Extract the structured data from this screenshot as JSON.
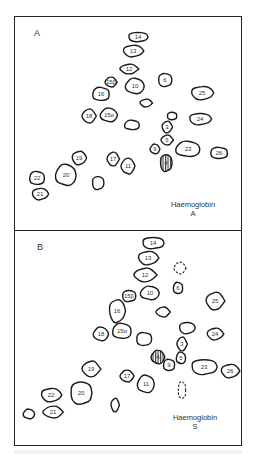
{
  "figure": {
    "panels": [
      {
        "id": "A",
        "label": "A",
        "caption_line1": "Haemoglobin",
        "caption_line2": "A",
        "spots": [
          {
            "label": "14",
            "cx": 123,
            "cy": 20,
            "rx": 10,
            "ry": 5
          },
          {
            "label": "13",
            "cx": 118,
            "cy": 34,
            "rx": 10,
            "ry": 6
          },
          {
            "label": "12",
            "cx": 114,
            "cy": 52,
            "rx": 9,
            "ry": 5
          },
          {
            "label": "15β",
            "cx": 96,
            "cy": 65,
            "rx": 6,
            "ry": 5
          },
          {
            "label": "10",
            "cx": 120,
            "cy": 69,
            "rx": 10,
            "ry": 8
          },
          {
            "label": "16",
            "cx": 86,
            "cy": 77,
            "rx": 9,
            "ry": 7
          },
          {
            "label": "6",
            "cx": 150,
            "cy": 63,
            "rx": 7,
            "ry": 7
          },
          {
            "label": "25",
            "cx": 187,
            "cy": 76,
            "rx": 11,
            "ry": 7
          },
          {
            "label": "",
            "cx": 131,
            "cy": 86,
            "rx": 6,
            "ry": 4
          },
          {
            "label": "18",
            "cx": 74,
            "cy": 99,
            "rx": 7,
            "ry": 7
          },
          {
            "label": "15α",
            "cx": 94,
            "cy": 98,
            "rx": 9,
            "ry": 7
          },
          {
            "label": "",
            "cx": 117,
            "cy": 108,
            "rx": 8,
            "ry": 5
          },
          {
            "label": "",
            "cx": 157,
            "cy": 99,
            "rx": 5,
            "ry": 4
          },
          {
            "label": "24",
            "cx": 185,
            "cy": 102,
            "rx": 11,
            "ry": 6
          },
          {
            "label": "3",
            "cx": 152,
            "cy": 110,
            "rx": 5,
            "ry": 6
          },
          {
            "label": "5",
            "cx": 152,
            "cy": 123,
            "rx": 6,
            "ry": 5
          },
          {
            "label": "9",
            "cx": 140,
            "cy": 132,
            "rx": 5,
            "ry": 5
          },
          {
            "label": "23",
            "cx": 173,
            "cy": 132,
            "rx": 13,
            "ry": 8
          },
          {
            "label": "26",
            "cx": 204,
            "cy": 136,
            "rx": 9,
            "ry": 6
          },
          {
            "label": "4",
            "cx": 151,
            "cy": 146,
            "rx": 6,
            "ry": 9,
            "hatched": true
          },
          {
            "label": "19",
            "cx": 64,
            "cy": 141,
            "rx": 7,
            "ry": 7
          },
          {
            "label": "17",
            "cx": 98,
            "cy": 142,
            "rx": 6,
            "ry": 7
          },
          {
            "label": "11",
            "cx": 113,
            "cy": 149,
            "rx": 7,
            "ry": 8
          },
          {
            "label": "20",
            "cx": 51,
            "cy": 158,
            "rx": 11,
            "ry": 11
          },
          {
            "label": "22",
            "cx": 22,
            "cy": 161,
            "rx": 8,
            "ry": 7
          },
          {
            "label": "",
            "cx": 83,
            "cy": 166,
            "rx": 6,
            "ry": 7
          },
          {
            "label": "21",
            "cx": 25,
            "cy": 177,
            "rx": 8,
            "ry": 6
          }
        ]
      },
      {
        "id": "B",
        "label": "B",
        "caption_line1": "Haemoglobin",
        "caption_line2": "S",
        "spots": [
          {
            "label": "14",
            "cx": 138,
            "cy": 12,
            "rx": 11,
            "ry": 6
          },
          {
            "label": "13",
            "cx": 133,
            "cy": 27,
            "rx": 10,
            "ry": 7
          },
          {
            "label": "12",
            "cx": 130,
            "cy": 44,
            "rx": 11,
            "ry": 7
          },
          {
            "label": "",
            "cx": 165,
            "cy": 37,
            "rx": 6,
            "ry": 6,
            "dashed": true
          },
          {
            "label": "10",
            "cx": 135,
            "cy": 62,
            "rx": 10,
            "ry": 7
          },
          {
            "label": "6",
            "cx": 163,
            "cy": 57,
            "rx": 5,
            "ry": 6
          },
          {
            "label": "15β",
            "cx": 114,
            "cy": 65,
            "rx": 7,
            "ry": 6
          },
          {
            "label": "16",
            "cx": 102,
            "cy": 80,
            "rx": 8,
            "ry": 12
          },
          {
            "label": "25",
            "cx": 200,
            "cy": 70,
            "rx": 9,
            "ry": 9
          },
          {
            "label": "",
            "cx": 148,
            "cy": 81,
            "rx": 7,
            "ry": 5
          },
          {
            "label": "18",
            "cx": 86,
            "cy": 103,
            "rx": 8,
            "ry": 7
          },
          {
            "label": "15α",
            "cx": 107,
            "cy": 100,
            "rx": 10,
            "ry": 8
          },
          {
            "label": "",
            "cx": 129,
            "cy": 108,
            "rx": 8,
            "ry": 7
          },
          {
            "label": "",
            "cx": 172,
            "cy": 97,
            "rx": 8,
            "ry": 6
          },
          {
            "label": "24",
            "cx": 200,
            "cy": 103,
            "rx": 8,
            "ry": 6
          },
          {
            "label": "3",
            "cx": 167,
            "cy": 113,
            "rx": 5,
            "ry": 7
          },
          {
            "label": "4",
            "cx": 143,
            "cy": 126,
            "rx": 7,
            "ry": 7,
            "hatched": true
          },
          {
            "label": "5",
            "cx": 166,
            "cy": 127,
            "rx": 5,
            "ry": 6
          },
          {
            "label": "9",
            "cx": 154,
            "cy": 134,
            "rx": 6,
            "ry": 6
          },
          {
            "label": "23",
            "cx": 189,
            "cy": 136,
            "rx": 13,
            "ry": 8
          },
          {
            "label": "26",
            "cx": 215,
            "cy": 140,
            "rx": 9,
            "ry": 7
          },
          {
            "label": "19",
            "cx": 76,
            "cy": 138,
            "rx": 9,
            "ry": 8
          },
          {
            "label": "17",
            "cx": 112,
            "cy": 145,
            "rx": 7,
            "ry": 6
          },
          {
            "label": "11",
            "cx": 131,
            "cy": 153,
            "rx": 9,
            "ry": 9
          },
          {
            "label": "",
            "cx": 167,
            "cy": 159,
            "rx": 4,
            "ry": 9,
            "dashed": true
          },
          {
            "label": "20",
            "cx": 66,
            "cy": 162,
            "rx": 11,
            "ry": 12
          },
          {
            "label": "22",
            "cx": 36,
            "cy": 164,
            "rx": 10,
            "ry": 7
          },
          {
            "label": "",
            "cx": 100,
            "cy": 174,
            "rx": 4,
            "ry": 7
          },
          {
            "label": "21",
            "cx": 38,
            "cy": 181,
            "rx": 10,
            "ry": 6
          },
          {
            "label": "",
            "cx": 14,
            "cy": 183,
            "rx": 6,
            "ry": 5
          }
        ]
      }
    ]
  }
}
